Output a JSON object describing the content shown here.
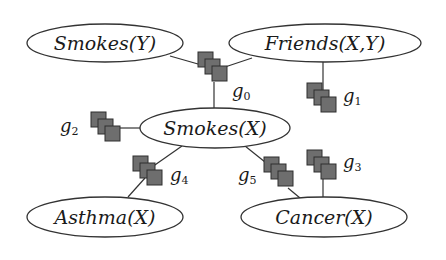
{
  "diagram": {
    "type": "factor-graph",
    "colors": {
      "background": "#ffffff",
      "edge": "#333333",
      "factor_fill": "#6e6e6e",
      "factor_stroke": "#2e2e2e",
      "node_stroke": "#333333",
      "text": "#1a1a1a"
    },
    "nodes": [
      {
        "id": "smokes_y",
        "label": "Smokes(Y)"
      },
      {
        "id": "friends_xy",
        "label": "Friends(X,Y)"
      },
      {
        "id": "smokes_x",
        "label": "Smokes(X)"
      },
      {
        "id": "asthma_x",
        "label": "Asthma(X)"
      },
      {
        "id": "cancer_x",
        "label": "Cancer(X)"
      }
    ],
    "factors": [
      {
        "id": "g0",
        "base": "g",
        "sub": "0",
        "connects": [
          "smokes_y",
          "friends_xy",
          "smokes_x"
        ]
      },
      {
        "id": "g1",
        "base": "g",
        "sub": "1",
        "connects": [
          "friends_xy"
        ]
      },
      {
        "id": "g2",
        "base": "g",
        "sub": "2",
        "connects": [
          "smokes_x"
        ]
      },
      {
        "id": "g3",
        "base": "g",
        "sub": "3",
        "connects": [
          "cancer_x"
        ]
      },
      {
        "id": "g4",
        "base": "g",
        "sub": "4",
        "connects": [
          "smokes_x",
          "asthma_x"
        ]
      },
      {
        "id": "g5",
        "base": "g",
        "sub": "5",
        "connects": [
          "smokes_x",
          "cancer_x"
        ]
      }
    ]
  }
}
